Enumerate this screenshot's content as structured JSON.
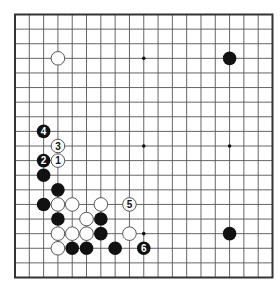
{
  "diagram": {
    "type": "go-board",
    "size": 19,
    "colors": {
      "background": "#ffffff",
      "line": "#555555",
      "border": "#333333",
      "black_stone": "#111111",
      "white_stone": "#ffffff",
      "white_stone_stroke": "#444444"
    },
    "star_points": [
      [
        3,
        3
      ],
      [
        9,
        3
      ],
      [
        15,
        3
      ],
      [
        3,
        9
      ],
      [
        9,
        9
      ],
      [
        15,
        9
      ],
      [
        3,
        15
      ],
      [
        9,
        15
      ],
      [
        15,
        15
      ]
    ],
    "stones": [
      {
        "color": "white",
        "col": 3,
        "row": 3,
        "label": ""
      },
      {
        "color": "black",
        "col": 15,
        "row": 3,
        "label": ""
      },
      {
        "color": "black",
        "col": 2,
        "row": 8,
        "label": "4"
      },
      {
        "color": "white",
        "col": 3,
        "row": 9,
        "label": "3"
      },
      {
        "color": "black",
        "col": 2,
        "row": 10,
        "label": "2"
      },
      {
        "color": "white",
        "col": 3,
        "row": 10,
        "label": "1"
      },
      {
        "color": "black",
        "col": 2,
        "row": 11,
        "label": ""
      },
      {
        "color": "black",
        "col": 3,
        "row": 12,
        "label": ""
      },
      {
        "color": "black",
        "col": 2,
        "row": 13,
        "label": ""
      },
      {
        "color": "white",
        "col": 3,
        "row": 13,
        "label": ""
      },
      {
        "color": "white",
        "col": 4,
        "row": 13,
        "label": ""
      },
      {
        "color": "white",
        "col": 6,
        "row": 13,
        "label": ""
      },
      {
        "color": "white",
        "col": 8,
        "row": 13,
        "label": "5"
      },
      {
        "color": "black",
        "col": 3,
        "row": 14,
        "label": ""
      },
      {
        "color": "white",
        "col": 5,
        "row": 14,
        "label": ""
      },
      {
        "color": "black",
        "col": 6,
        "row": 14,
        "label": ""
      },
      {
        "color": "white",
        "col": 3,
        "row": 15,
        "label": ""
      },
      {
        "color": "white",
        "col": 4,
        "row": 15,
        "label": ""
      },
      {
        "color": "white",
        "col": 5,
        "row": 15,
        "label": ""
      },
      {
        "color": "black",
        "col": 6,
        "row": 15,
        "label": ""
      },
      {
        "color": "white",
        "col": 8,
        "row": 15,
        "label": ""
      },
      {
        "color": "black",
        "col": 15,
        "row": 15,
        "label": ""
      },
      {
        "color": "white",
        "col": 3,
        "row": 16,
        "label": ""
      },
      {
        "color": "black",
        "col": 4,
        "row": 16,
        "label": ""
      },
      {
        "color": "black",
        "col": 5,
        "row": 16,
        "label": ""
      },
      {
        "color": "black",
        "col": 7,
        "row": 16,
        "label": ""
      },
      {
        "color": "black",
        "col": 9,
        "row": 16,
        "label": "6"
      }
    ]
  }
}
